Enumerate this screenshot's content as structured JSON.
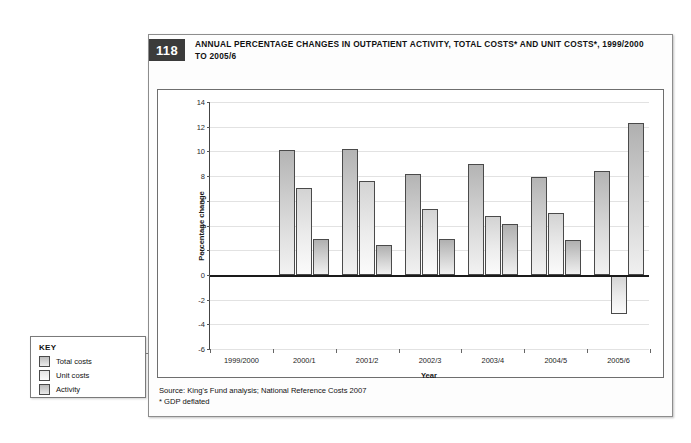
{
  "figure": {
    "number": "118",
    "title": "ANNUAL PERCENTAGE CHANGES IN OUTPATIENT ACTIVITY, TOTAL COSTS* AND UNIT COSTS*, 1999/2000 TO 2005/6",
    "source_line_1": "Source: King's Fund analysis; National Reference Costs 2007",
    "source_line_2": "* GDP deflated"
  },
  "key": {
    "title": "KEY",
    "items": [
      {
        "label": "Total costs",
        "swatch": "total"
      },
      {
        "label": "Unit costs",
        "swatch": "unit"
      },
      {
        "label": "Activity",
        "swatch": "activity"
      }
    ]
  },
  "chart_data": {
    "type": "bar",
    "title": "ANNUAL PERCENTAGE CHANGES IN OUTPATIENT ACTIVITY, TOTAL COSTS* AND UNIT COSTS*, 1999/2000 TO 2005/6",
    "xlabel": "Year",
    "ylabel": "Percentage change",
    "ylim": [
      -6,
      14
    ],
    "yticks": [
      -6,
      -4,
      -2,
      0,
      2,
      4,
      6,
      8,
      10,
      12,
      14
    ],
    "ytick_labels": [
      "-6",
      "-4",
      "-2",
      "0",
      "2",
      "4",
      "6",
      "8",
      "10",
      "12",
      "14"
    ],
    "grid": true,
    "legend_position": "external-key-box-left",
    "categories": [
      "1999/2000",
      "2000/1",
      "2001/2",
      "2002/3",
      "2003/4",
      "2004/5",
      "2005/6"
    ],
    "series": [
      {
        "name": "Total costs",
        "values": [
          null,
          10.1,
          10.2,
          8.2,
          9.0,
          7.9,
          8.4
        ]
      },
      {
        "name": "Unit costs",
        "values": [
          null,
          7.0,
          7.6,
          5.3,
          4.8,
          5.0,
          -3.2
        ]
      },
      {
        "name": "Activity",
        "values": [
          null,
          2.9,
          2.4,
          2.9,
          4.1,
          2.8,
          12.3
        ]
      }
    ]
  },
  "colors": {
    "badge_bg": "#3b3b3b",
    "zero_line": "#1a1a1a",
    "gridline": "#e2e2e2",
    "bar_total": "#cfcfcf",
    "bar_unit": "#ededed",
    "bar_activity": "#c9c9c9"
  }
}
